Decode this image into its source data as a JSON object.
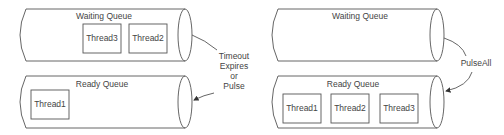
{
  "diagrams": [
    {
      "waiting_queue": {
        "label": "Waiting Queue",
        "threads": [
          "Thread3",
          "Thread2"
        ]
      },
      "ready_queue": {
        "label": "Ready Queue",
        "threads": [
          "Thread1"
        ]
      },
      "transition": {
        "lines": [
          "Timeout",
          "Expires",
          "or",
          "Pulse"
        ]
      }
    },
    {
      "waiting_queue": {
        "label": "Waiting Queue",
        "threads": []
      },
      "ready_queue": {
        "label": "Ready Queue",
        "threads": [
          "Thread1",
          "Thread2",
          "Thread3"
        ]
      },
      "transition": {
        "lines": [
          "PulseAll"
        ]
      }
    }
  ]
}
